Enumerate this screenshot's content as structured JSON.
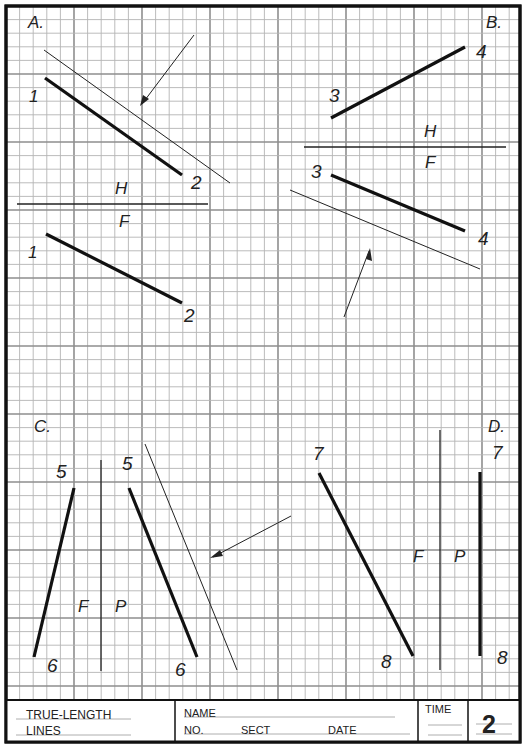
{
  "sheet": {
    "colors": {
      "paper": "#ffffff",
      "grid_minor": "#b4b4b4",
      "grid_major": "#8e8e8e",
      "ink": "#111111",
      "border": "#111111"
    },
    "frame": {
      "left": 6,
      "top": 6,
      "right": 520,
      "bottom": 742,
      "title_top": 700
    },
    "grid": {
      "origin_x": 6,
      "origin_y": 6,
      "minor": 13.6,
      "major_every": 5
    }
  },
  "problems": {
    "A": {
      "label": "A.",
      "top_view": {
        "p1": "1",
        "p2": "2"
      },
      "front_view": {
        "p1": "1",
        "p2": "2"
      },
      "fold_top": "H",
      "fold_bottom": "F"
    },
    "B": {
      "label": "B.",
      "top_view": {
        "p1": "3",
        "p2": "4"
      },
      "front_view": {
        "p1": "3",
        "p2": "4"
      },
      "fold_top": "H",
      "fold_bottom": "F"
    },
    "C": {
      "label": "C.",
      "front_view": {
        "p1": "5",
        "p2": "6"
      },
      "profile_view": {
        "p1": "5",
        "p2": "6"
      },
      "fold_left": "F",
      "fold_right": "P"
    },
    "D": {
      "label": "D.",
      "front_view": {
        "p1": "7",
        "p2": "8"
      },
      "profile_view": {
        "p1": "7",
        "p2": "8"
      },
      "fold_left": "F",
      "fold_right": "P"
    }
  },
  "title_block": {
    "title_line1": "TRUE-LENGTH",
    "title_line2": "LINES",
    "name_label": "NAME",
    "no_label": "NO.",
    "sect_label": "SECT",
    "date_label": "DATE",
    "time_label": "TIME",
    "sheet_number": "2"
  }
}
